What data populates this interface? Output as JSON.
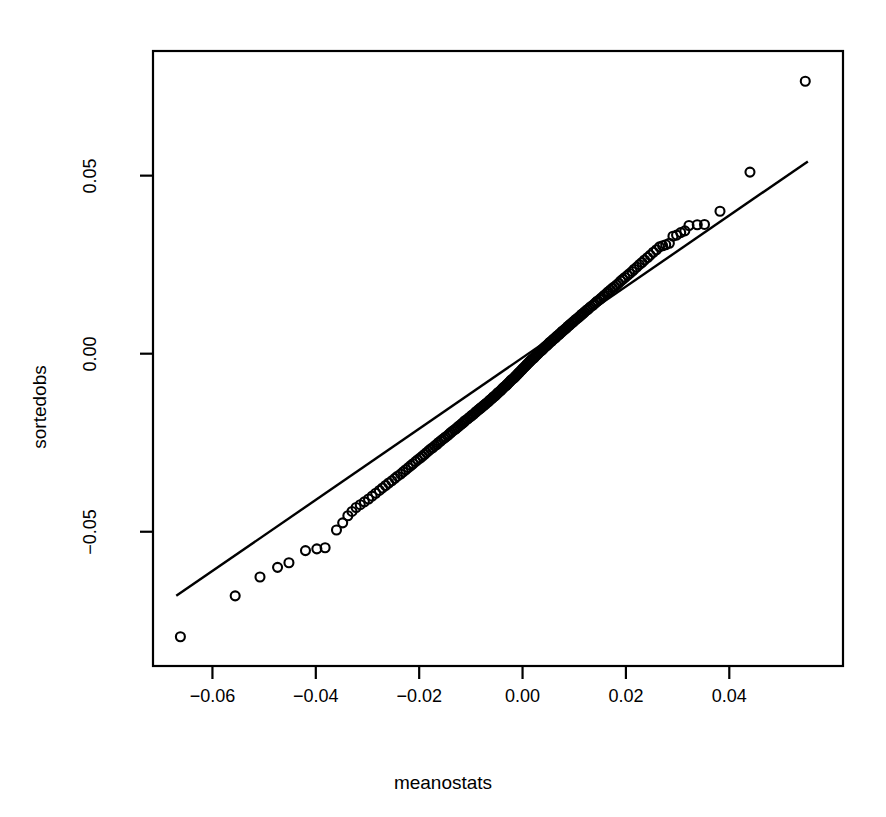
{
  "chart_data": {
    "type": "scatter",
    "title": "",
    "subtitle": "",
    "xlabel": "meanostats",
    "ylabel": "sortedobs",
    "xlim": [
      -0.0715,
      0.062
    ],
    "ylim": [
      -0.0877,
      0.085
    ],
    "xticks": [
      -0.06,
      -0.04,
      -0.02,
      0.0,
      0.02,
      0.04
    ],
    "xticklabels": [
      "−0.06",
      "−0.04",
      "−0.02",
      "0.00",
      "0.02",
      "0.04"
    ],
    "yticks": [
      -0.05,
      0.0,
      0.05
    ],
    "yticklabels": [
      "−0.05",
      "0.00",
      "0.05"
    ],
    "grid": false,
    "legend": null,
    "legend_position": "none",
    "marker": "open-circle",
    "marker_size_px": 9,
    "marker_color": "#000000",
    "line_color": "#000000",
    "frame": "box",
    "reference_line": {
      "description": "quantile-quantile reference line",
      "x": [
        -0.067,
        0.0552
      ],
      "y": [
        -0.068,
        0.054
      ]
    },
    "series": [
      {
        "name": "sortedobs vs meanostats",
        "points": [
          [
            -0.0662,
            -0.0795
          ],
          [
            -0.0556,
            -0.068
          ],
          [
            -0.0508,
            -0.0627
          ],
          [
            -0.0474,
            -0.06
          ],
          [
            -0.0452,
            -0.0587
          ],
          [
            -0.042,
            -0.0553
          ],
          [
            -0.0398,
            -0.0548
          ],
          [
            -0.0382,
            -0.0545
          ],
          [
            -0.036,
            -0.0495
          ],
          [
            -0.0348,
            -0.0475
          ],
          [
            -0.0338,
            -0.0455
          ],
          [
            -0.033,
            -0.0443
          ],
          [
            -0.0322,
            -0.0432
          ],
          [
            -0.0314,
            -0.0424
          ],
          [
            -0.0306,
            -0.0416
          ],
          [
            -0.0298,
            -0.0408
          ],
          [
            -0.0291,
            -0.04
          ],
          [
            -0.0284,
            -0.0392
          ],
          [
            -0.0277,
            -0.0384
          ],
          [
            -0.0271,
            -0.0377
          ],
          [
            -0.0265,
            -0.037
          ],
          [
            -0.0259,
            -0.0363
          ],
          [
            -0.0253,
            -0.0357
          ],
          [
            -0.0247,
            -0.035
          ],
          [
            -0.0242,
            -0.0344
          ],
          [
            -0.0236,
            -0.0338
          ],
          [
            -0.0231,
            -0.0332
          ],
          [
            -0.0226,
            -0.0326
          ],
          [
            -0.0221,
            -0.032
          ],
          [
            -0.0216,
            -0.0314
          ],
          [
            -0.0212,
            -0.0309
          ],
          [
            -0.0207,
            -0.0303
          ],
          [
            -0.0203,
            -0.0298
          ],
          [
            -0.0198,
            -0.0293
          ],
          [
            -0.0194,
            -0.0288
          ],
          [
            -0.019,
            -0.0283
          ],
          [
            -0.0186,
            -0.0278
          ],
          [
            -0.0182,
            -0.0273
          ],
          [
            -0.0178,
            -0.0268
          ],
          [
            -0.0174,
            -0.0264
          ],
          [
            -0.017,
            -0.0259
          ],
          [
            -0.0166,
            -0.0255
          ],
          [
            -0.0163,
            -0.025
          ],
          [
            -0.0159,
            -0.0246
          ],
          [
            -0.0156,
            -0.0242
          ],
          [
            -0.0152,
            -0.0238
          ],
          [
            -0.0149,
            -0.0234
          ],
          [
            -0.0145,
            -0.023
          ],
          [
            -0.0142,
            -0.0226
          ],
          [
            -0.0139,
            -0.0222
          ],
          [
            -0.0136,
            -0.0218
          ],
          [
            -0.0132,
            -0.0214
          ],
          [
            -0.0129,
            -0.0211
          ],
          [
            -0.0126,
            -0.0207
          ],
          [
            -0.0123,
            -0.0203
          ],
          [
            -0.012,
            -0.02
          ],
          [
            -0.0117,
            -0.0196
          ],
          [
            -0.0114,
            -0.0193
          ],
          [
            -0.0112,
            -0.0189
          ],
          [
            -0.0109,
            -0.0186
          ],
          [
            -0.0106,
            -0.0183
          ],
          [
            -0.0103,
            -0.0179
          ],
          [
            -0.01,
            -0.0176
          ],
          [
            -0.0098,
            -0.0173
          ],
          [
            -0.0095,
            -0.017
          ],
          [
            -0.0092,
            -0.0166
          ],
          [
            -0.009,
            -0.0163
          ],
          [
            -0.0087,
            -0.016
          ],
          [
            -0.0085,
            -0.0157
          ],
          [
            -0.0082,
            -0.0154
          ],
          [
            -0.008,
            -0.0151
          ],
          [
            -0.0077,
            -0.0148
          ],
          [
            -0.0075,
            -0.0145
          ],
          [
            -0.0072,
            -0.0142
          ],
          [
            -0.007,
            -0.0139
          ],
          [
            -0.0067,
            -0.0136
          ],
          [
            -0.0065,
            -0.0133
          ],
          [
            -0.0063,
            -0.013
          ],
          [
            -0.006,
            -0.0127
          ],
          [
            -0.0058,
            -0.0124
          ],
          [
            -0.0056,
            -0.0121
          ],
          [
            -0.0053,
            -0.0118
          ],
          [
            -0.0051,
            -0.0115
          ],
          [
            -0.0049,
            -0.0112
          ],
          [
            -0.0047,
            -0.0109
          ],
          [
            -0.0044,
            -0.0106
          ],
          [
            -0.0042,
            -0.0103
          ],
          [
            -0.004,
            -0.01
          ],
          [
            -0.0038,
            -0.0097
          ],
          [
            -0.0036,
            -0.0094
          ],
          [
            -0.0033,
            -0.0091
          ],
          [
            -0.0031,
            -0.0088
          ],
          [
            -0.0029,
            -0.0085
          ],
          [
            -0.0027,
            -0.0082
          ],
          [
            -0.0025,
            -0.0079
          ],
          [
            -0.0023,
            -0.0076
          ],
          [
            -0.0021,
            -0.0073
          ],
          [
            -0.0018,
            -0.007
          ],
          [
            -0.0016,
            -0.0067
          ],
          [
            -0.0014,
            -0.0064
          ],
          [
            -0.0012,
            -0.0061
          ],
          [
            -0.001,
            -0.0058
          ],
          [
            -0.0008,
            -0.0055
          ],
          [
            -0.0006,
            -0.0052
          ],
          [
            -0.0004,
            -0.0049
          ],
          [
            -0.0002,
            -0.0046
          ],
          [
            0.0,
            -0.0043
          ],
          [
            0.0002,
            -0.004
          ],
          [
            0.0004,
            -0.0037
          ],
          [
            0.0006,
            -0.0034
          ],
          [
            0.0008,
            -0.0031
          ],
          [
            0.001,
            -0.0028
          ],
          [
            0.0012,
            -0.0025
          ],
          [
            0.0014,
            -0.0022
          ],
          [
            0.0016,
            -0.0019
          ],
          [
            0.0018,
            -0.0016
          ],
          [
            0.0021,
            -0.0013
          ],
          [
            0.0023,
            -0.001
          ],
          [
            0.0025,
            -0.0007
          ],
          [
            0.0027,
            -0.0004
          ],
          [
            0.0029,
            -0.0001
          ],
          [
            0.0031,
            0.0002
          ],
          [
            0.0033,
            0.0005
          ],
          [
            0.0036,
            0.0008
          ],
          [
            0.0038,
            0.0011
          ],
          [
            0.004,
            0.0014
          ],
          [
            0.0042,
            0.0017
          ],
          [
            0.0044,
            0.002
          ],
          [
            0.0047,
            0.0023
          ],
          [
            0.0049,
            0.0026
          ],
          [
            0.0051,
            0.0029
          ],
          [
            0.0053,
            0.0032
          ],
          [
            0.0056,
            0.0035
          ],
          [
            0.0058,
            0.0038
          ],
          [
            0.006,
            0.0041
          ],
          [
            0.0063,
            0.0044
          ],
          [
            0.0065,
            0.0047
          ],
          [
            0.0067,
            0.005
          ],
          [
            0.007,
            0.0053
          ],
          [
            0.0072,
            0.0056
          ],
          [
            0.0075,
            0.006
          ],
          [
            0.0077,
            0.0063
          ],
          [
            0.008,
            0.0066
          ],
          [
            0.0082,
            0.0069
          ],
          [
            0.0085,
            0.0072
          ],
          [
            0.0087,
            0.0076
          ],
          [
            0.009,
            0.0079
          ],
          [
            0.0092,
            0.0082
          ],
          [
            0.0095,
            0.0086
          ],
          [
            0.0098,
            0.0089
          ],
          [
            0.01,
            0.0092
          ],
          [
            0.0103,
            0.0096
          ],
          [
            0.0106,
            0.0099
          ],
          [
            0.0109,
            0.0103
          ],
          [
            0.0112,
            0.0106
          ],
          [
            0.0114,
            0.011
          ],
          [
            0.0117,
            0.0113
          ],
          [
            0.012,
            0.0117
          ],
          [
            0.0123,
            0.0121
          ],
          [
            0.0126,
            0.0124
          ],
          [
            0.0129,
            0.0128
          ],
          [
            0.0132,
            0.0132
          ],
          [
            0.0136,
            0.0136
          ],
          [
            0.0139,
            0.014
          ],
          [
            0.0142,
            0.0144
          ],
          [
            0.0145,
            0.0148
          ],
          [
            0.0149,
            0.0152
          ],
          [
            0.0152,
            0.0156
          ],
          [
            0.0156,
            0.0161
          ],
          [
            0.0159,
            0.0165
          ],
          [
            0.0163,
            0.017
          ],
          [
            0.0166,
            0.0174
          ],
          [
            0.017,
            0.0179
          ],
          [
            0.0174,
            0.0184
          ],
          [
            0.0178,
            0.0188
          ],
          [
            0.0182,
            0.0193
          ],
          [
            0.0186,
            0.0198
          ],
          [
            0.019,
            0.0204
          ],
          [
            0.0194,
            0.0209
          ],
          [
            0.0198,
            0.0214
          ],
          [
            0.0203,
            0.022
          ],
          [
            0.0207,
            0.0225
          ],
          [
            0.0212,
            0.0231
          ],
          [
            0.0216,
            0.0237
          ],
          [
            0.0221,
            0.0243
          ],
          [
            0.0226,
            0.025
          ],
          [
            0.0231,
            0.0256
          ],
          [
            0.0236,
            0.0263
          ],
          [
            0.0242,
            0.027
          ],
          [
            0.0247,
            0.0277
          ],
          [
            0.0253,
            0.0285
          ],
          [
            0.0259,
            0.0292
          ],
          [
            0.0265,
            0.03
          ],
          [
            0.0271,
            0.0303
          ],
          [
            0.0277,
            0.0306
          ],
          [
            0.0284,
            0.031
          ],
          [
            0.0291,
            0.033
          ],
          [
            0.0298,
            0.0333
          ],
          [
            0.0306,
            0.034
          ],
          [
            0.0314,
            0.0345
          ],
          [
            0.0322,
            0.036
          ],
          [
            0.0338,
            0.0362
          ],
          [
            0.0352,
            0.0363
          ],
          [
            0.0382,
            0.04
          ],
          [
            0.044,
            0.051
          ],
          [
            0.0547,
            0.0765
          ]
        ]
      }
    ]
  }
}
